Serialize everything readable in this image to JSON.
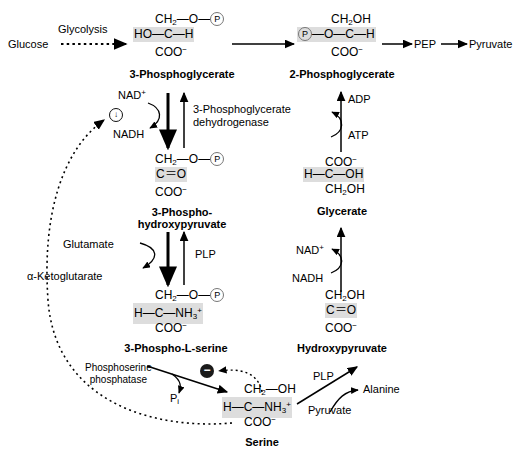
{
  "diagram": {
    "type": "biochemical-pathway"
  },
  "nodes": {
    "glucose": "Glucose",
    "glycolysis": "Glycolysis",
    "pg3_name": "3-Phosphoglycerate",
    "pg2_name": "2-Phosphoglycerate",
    "pep": "PEP",
    "pyruvate_top": "Pyruvate",
    "php_name_1": "3-Phospho-",
    "php_name_2": "hydroxypyruvate",
    "psl_name": "3-Phospho-L-serine",
    "serine_name": "Serine",
    "glycerate_name": "Glycerate",
    "hydroxypyruvate_name": "Hydroxypyruvate"
  },
  "enzymes": {
    "pgdh_1": "3-Phosphoglycerate",
    "pgdh_2": "dehydrogenase",
    "plp_left": "PLP",
    "plp_right": "PLP",
    "phosphoserine_phosphatase_1": "Phosphoserine",
    "phosphoserine_phosphatase_2": "phosphatase"
  },
  "cofactors": {
    "nad_plus_left": "NAD",
    "nad_plus_left_sup": "+",
    "nadh_left": "NADH",
    "adp": "ADP",
    "atp": "ATP",
    "nad_plus_right": "NAD",
    "nad_plus_right_sup": "+",
    "nadh_right": "NADH",
    "glutamate": "Glutamate",
    "alpha_ketoglutarate": "α-Ketoglutarate",
    "pi": "P",
    "pi_sub": "i",
    "alanine": "Alanine",
    "pyruvate_bottom": "Pyruvate"
  },
  "structures": {
    "pg3": {
      "label": "3-Phosphoglycerate",
      "row1": [
        "CH",
        "2",
        "—O—",
        "P"
      ],
      "row2": "HO—C—H",
      "row3": [
        "COO",
        "−"
      ]
    },
    "pg2": {
      "label": "2-Phosphoglycerate",
      "row1": [
        "CH",
        "2",
        "OH"
      ],
      "row2": [
        "P",
        "—O—C—H"
      ],
      "row3": [
        "COO",
        "−"
      ]
    },
    "php": {
      "label": "3-Phosphohydroxypyruvate",
      "row1": [
        "CH",
        "2",
        "—O—",
        "P"
      ],
      "row2": "C＝O",
      "row3": [
        "COO",
        "−"
      ]
    },
    "psl": {
      "label": "3-Phospho-L-serine",
      "row1": [
        "CH",
        "2",
        "—O—",
        "P"
      ],
      "row2": [
        "H—C—NH",
        "3",
        "+"
      ],
      "row3": [
        "COO",
        "−"
      ]
    },
    "serine": {
      "label": "Serine",
      "row1": [
        "CH",
        "2",
        "—OH"
      ],
      "row2": [
        "H—C—NH",
        "3",
        "+"
      ],
      "row3": [
        "COO",
        "−"
      ]
    },
    "glycerate": {
      "label": "Glycerate",
      "row1": [
        "COO",
        "−"
      ],
      "row2": "H—C—OH",
      "row3": [
        "CH",
        "2",
        "OH"
      ]
    },
    "hydroxypyruvate": {
      "label": "Hydroxypyruvate",
      "row1": [
        "CH",
        "2",
        "OH"
      ],
      "row2": "C＝O",
      "row3": [
        "COO",
        "−"
      ]
    }
  },
  "symbols": {
    "inhibition_minus": "−",
    "decrease_arrow": "↓",
    "phosphate_circle": "P"
  },
  "colors": {
    "ink": "#000000",
    "highlight_band": "#dddddd",
    "phosphate_ring": "#777777",
    "inhibition_badge": "#1a1a1a"
  }
}
